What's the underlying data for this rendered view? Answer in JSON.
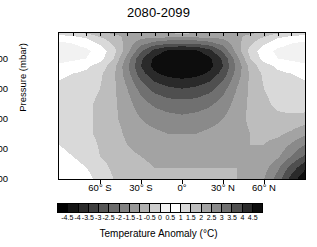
{
  "chart_data": {
    "type": "heatmap",
    "title": "2080-2099",
    "xlabel": "",
    "ylabel": "Pressure (mbar)",
    "colorbar_label": "Temperature Anomaly (°C)",
    "grid": false,
    "legend_position": "bottom",
    "colormap": "grayscale-diverging",
    "x": {
      "name": "latitude",
      "tick_labels": [
        "60° S",
        "30° S",
        "0°",
        "30° N",
        "60° N"
      ],
      "tick_values": [
        -60,
        -30,
        0,
        30,
        60
      ],
      "range": [
        -90,
        90
      ]
    },
    "y": {
      "name": "pressure",
      "units": "mbar",
      "tick_labels": [
        "200",
        "400",
        "600",
        "800",
        "1000"
      ],
      "tick_values": [
        200,
        400,
        600,
        800,
        1000
      ],
      "range": [
        30,
        1000
      ],
      "inverted": true
    },
    "zlim": [
      -5.0,
      5.0
    ],
    "contour_levels": [
      -4.5,
      -4,
      -3.5,
      -3,
      -2.5,
      -2,
      -1.5,
      -1,
      -0.5,
      0,
      0.5,
      1,
      1.5,
      2,
      2.5,
      3,
      3.5,
      4,
      4.5
    ],
    "colorbar_ticks": [
      "-4.5",
      "-4",
      "-3.5",
      "-3",
      "-2.5",
      "-2",
      "-1.5",
      "-1",
      "-0.5",
      "0",
      "0.5",
      "1",
      "1.5",
      "2",
      "2.5",
      "3",
      "3.5",
      "4",
      "4.5"
    ],
    "colorbar_swatches": [
      "#000000",
      "#141414",
      "#2b2b2b",
      "#3f3f3f",
      "#565656",
      "#6b6b6b",
      "#818181",
      "#979797",
      "#b0b0b0",
      "#cdcdcd",
      "#f2f2f2",
      "#ffffff",
      "#d9d9d9",
      "#bdbdbd",
      "#a3a3a3",
      "#8a8a8a",
      "#707070",
      "#4f4f4f",
      "#2a2a2a",
      "#0d0d0d"
    ],
    "z_grid_latitudes": [
      -90,
      -80,
      -70,
      -60,
      -50,
      -40,
      -30,
      -20,
      -10,
      0,
      10,
      20,
      30,
      40,
      50,
      60,
      70,
      80,
      90
    ],
    "z_grid_pressures": [
      30,
      50,
      100,
      150,
      200,
      250,
      300,
      400,
      500,
      600,
      700,
      850,
      925,
      1000
    ],
    "z_values": [
      [
        1.3,
        1.4,
        1.6,
        1.9,
        2.1,
        2.2,
        2.2,
        2.1,
        2.0,
        1.9,
        2.0,
        2.1,
        2.2,
        2.2,
        2.1,
        1.9,
        1.6,
        1.4,
        1.3
      ],
      [
        0.9,
        1.0,
        1.2,
        1.6,
        1.9,
        2.1,
        2.2,
        2.2,
        2.2,
        2.2,
        2.2,
        2.2,
        2.2,
        2.1,
        1.9,
        1.6,
        1.2,
        1.0,
        0.9
      ],
      [
        0.4,
        0.5,
        0.7,
        1.1,
        1.6,
        2.2,
        2.8,
        3.2,
        3.4,
        3.5,
        3.4,
        3.2,
        2.8,
        2.2,
        1.6,
        1.1,
        0.7,
        0.5,
        0.4
      ],
      [
        0.2,
        0.3,
        0.4,
        0.7,
        1.3,
        2.3,
        3.4,
        4.2,
        4.6,
        4.7,
        4.6,
        4.2,
        3.4,
        2.3,
        1.3,
        0.7,
        0.4,
        0.3,
        0.2
      ],
      [
        0.3,
        0.4,
        0.5,
        0.8,
        1.5,
        2.7,
        3.9,
        4.6,
        4.9,
        5.0,
        4.9,
        4.6,
        3.9,
        2.7,
        1.5,
        0.8,
        0.5,
        0.4,
        0.3
      ],
      [
        0.6,
        0.7,
        0.9,
        1.2,
        1.8,
        2.9,
        4.0,
        4.7,
        4.9,
        5.0,
        4.9,
        4.7,
        4.0,
        2.9,
        1.8,
        1.2,
        0.9,
        0.7,
        0.6
      ],
      [
        0.9,
        1.0,
        1.1,
        1.4,
        1.9,
        2.8,
        3.8,
        4.4,
        4.7,
        4.8,
        4.7,
        4.4,
        3.8,
        2.8,
        1.9,
        1.4,
        1.1,
        1.0,
        0.9
      ],
      [
        1.1,
        1.2,
        1.3,
        1.5,
        1.9,
        2.5,
        3.2,
        3.7,
        3.9,
        4.0,
        3.9,
        3.7,
        3.2,
        2.5,
        1.9,
        1.5,
        1.3,
        1.2,
        1.1
      ],
      [
        1.2,
        1.3,
        1.4,
        1.6,
        1.9,
        2.3,
        2.8,
        3.1,
        3.3,
        3.3,
        3.3,
        3.1,
        2.8,
        2.3,
        1.9,
        1.6,
        1.4,
        1.3,
        1.2
      ],
      [
        1.2,
        1.3,
        1.4,
        1.6,
        1.9,
        2.2,
        2.5,
        2.7,
        2.8,
        2.9,
        2.8,
        2.7,
        2.5,
        2.2,
        1.9,
        1.7,
        1.6,
        1.6,
        1.7
      ],
      [
        1.1,
        1.2,
        1.4,
        1.6,
        1.8,
        2.1,
        2.3,
        2.4,
        2.5,
        2.5,
        2.5,
        2.4,
        2.3,
        2.2,
        2.0,
        1.9,
        1.9,
        2.1,
        2.4
      ],
      [
        0.9,
        1.0,
        1.2,
        1.5,
        1.7,
        1.9,
        2.0,
        2.1,
        2.2,
        2.2,
        2.2,
        2.2,
        2.1,
        2.1,
        2.0,
        2.1,
        2.4,
        3.0,
        3.6
      ],
      [
        0.7,
        0.8,
        1.0,
        1.3,
        1.6,
        1.8,
        1.9,
        2.0,
        2.0,
        2.0,
        2.0,
        2.0,
        2.0,
        2.0,
        2.1,
        2.3,
        2.9,
        3.7,
        4.4
      ],
      [
        0.5,
        0.6,
        0.8,
        1.2,
        1.5,
        1.7,
        1.8,
        1.9,
        1.9,
        1.9,
        1.9,
        1.9,
        1.9,
        2.0,
        2.1,
        2.5,
        3.2,
        4.2,
        4.9
      ]
    ]
  }
}
